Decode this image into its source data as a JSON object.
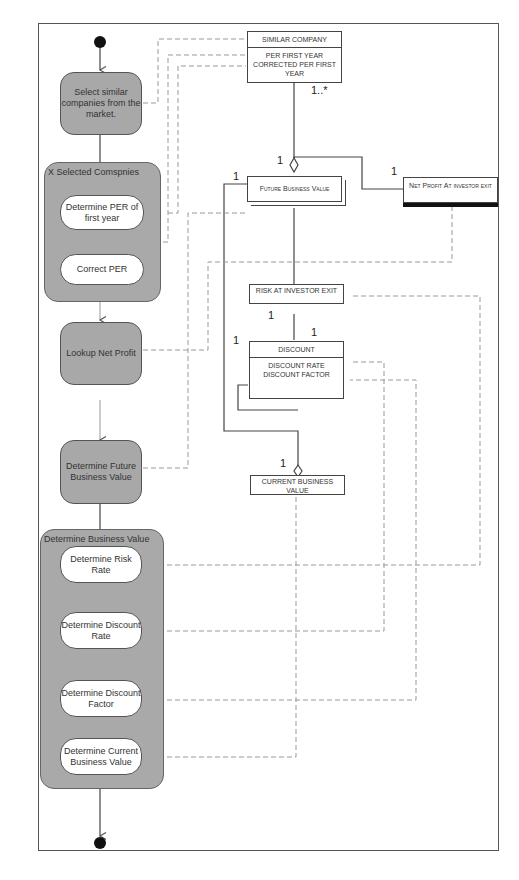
{
  "diagram": {
    "type": "UML activity diagram with object flows",
    "activities": {
      "select_similar": "Select similar companies from the market.",
      "determine_per": "Determine PER of first year",
      "correct_per": "Correct PER",
      "lookup_net_profit": "Lookup Net Profit",
      "determine_future_bv": "Determine Future Business Value",
      "determine_risk_rate": "Determine Risk Rate",
      "determine_discount_rate": "Determine Discount Rate",
      "determine_discount_factor": "Determine Discount Factor",
      "determine_current_bv": "Determine Current Business Value"
    },
    "regions": {
      "selected_companies": "X Selected Comspnies",
      "determine_business_value": "Determine Business Value"
    },
    "classes": {
      "similar_company": {
        "name": "SIMILAR COMPANY",
        "attributes": "PER FIRST YEAR CORRECTED PER FIRST YEAR"
      },
      "future_business_value": {
        "name": "Future Business Value"
      },
      "net_profit": {
        "name": "Net Profit At investor exit"
      },
      "risk_at_exit": {
        "name": "RISK AT INVESTOR EXIT"
      },
      "discount": {
        "name": "DISCOUNT",
        "attributes": "DISCOUNT RATE DISCOUNT FACTOR"
      },
      "current_business_value": {
        "name": "CURRENT BUSINESS VALUE"
      }
    },
    "multiplicities": {
      "similar_many": "1..*",
      "fbv_top": "1",
      "fbv_left": "1",
      "net_profit": "1",
      "risk": "1",
      "discount_top": "1",
      "discount_left": "1",
      "current_bv": "1"
    }
  }
}
